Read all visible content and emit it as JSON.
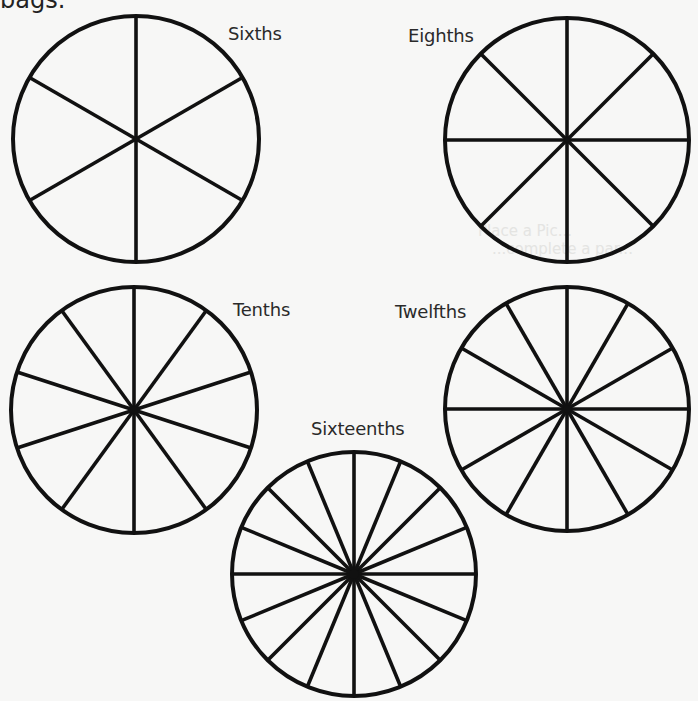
{
  "header_fragment": "bags.",
  "bleed_through": [
    "Place a Pic...",
    "...complete a par..."
  ],
  "stroke_color": "#111111",
  "background_color": "#f7f7f6",
  "circles": [
    {
      "id": "sixths",
      "label": "Sixths",
      "divisions": 6,
      "cx": 136,
      "cy": 139,
      "r": 123,
      "label_x": 228,
      "label_y": 25,
      "offset_deg": 0
    },
    {
      "id": "eighths",
      "label": "Eighths",
      "divisions": 8,
      "cx": 567,
      "cy": 140,
      "r": 122,
      "label_x": 408,
      "label_y": 27,
      "offset_deg": 0
    },
    {
      "id": "tenths",
      "label": "Tenths",
      "divisions": 10,
      "cx": 134,
      "cy": 410,
      "r": 123,
      "label_x": 233,
      "label_y": 301,
      "offset_deg": 0
    },
    {
      "id": "twelfths",
      "label": "Twelfths",
      "divisions": 12,
      "cx": 567,
      "cy": 409,
      "r": 122,
      "label_x": 395,
      "label_y": 303,
      "offset_deg": 0
    },
    {
      "id": "sixteenths",
      "label": "Sixteenths",
      "divisions": 16,
      "cx": 354,
      "cy": 574,
      "r": 122,
      "label_x": 311,
      "label_y": 420,
      "offset_deg": 0
    }
  ]
}
